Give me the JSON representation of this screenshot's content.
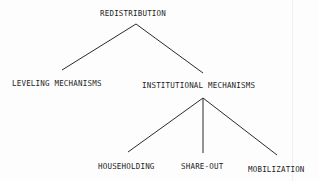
{
  "diagram": {
    "type": "tree",
    "root": {
      "label": "REDISTRIBUTION",
      "children": [
        {
          "label": "LEVELING MECHANISMS",
          "children": []
        },
        {
          "label": "INSTITUTIONAL MECHANISMS",
          "children": [
            {
              "label": "HOUSEHOLDING",
              "children": []
            },
            {
              "label": "SHARE-OUT",
              "children": []
            },
            {
              "label": "MOBILIZATION",
              "children": []
            }
          ]
        }
      ]
    }
  },
  "nodes": {
    "redistribution": "REDISTRIBUTION",
    "leveling": "LEVELING MECHANISMS",
    "institutional": "INSTITUTIONAL MECHANISMS",
    "householding": "HOUSEHOLDING",
    "share_out": "SHARE-OUT",
    "mobilization": "MOBILIZATION"
  },
  "edges": [
    {
      "from": "REDISTRIBUTION",
      "to": "LEVELING MECHANISMS"
    },
    {
      "from": "REDISTRIBUTION",
      "to": "INSTITUTIONAL MECHANISMS"
    },
    {
      "from": "INSTITUTIONAL MECHANISMS",
      "to": "HOUSEHOLDING"
    },
    {
      "from": "INSTITUTIONAL MECHANISMS",
      "to": "SHARE-OUT"
    },
    {
      "from": "INSTITUTIONAL MECHANISMS",
      "to": "MOBILIZATION"
    }
  ],
  "colors": {
    "background": "#fdfdfd",
    "ink": "#1e1e1e"
  }
}
